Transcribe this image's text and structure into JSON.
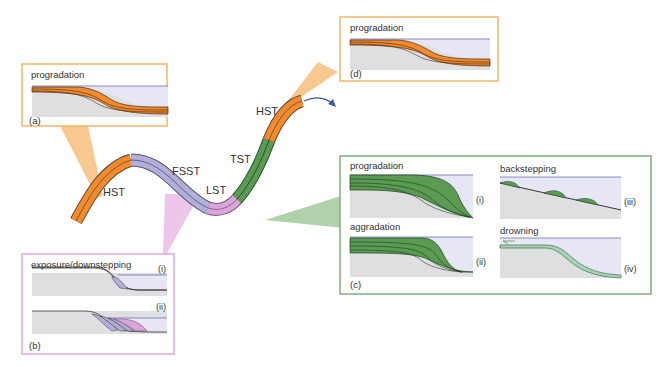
{
  "colors": {
    "orange": "#f28a2e",
    "orange_frame": "#f4b66a",
    "purple": "#b3b0d8",
    "pink": "#d9a6d9",
    "pink_frame": "#e2a6dc",
    "green": "#5a9a52",
    "green_frame": "#7fb07a",
    "sea": "#e6e6f5",
    "sea_line": "#6a6fb8",
    "basement": "#dedfe1",
    "arrow": "#3b5aa0"
  },
  "curve": {
    "labels": {
      "hst_left": "HST",
      "fsst": "FSST",
      "lst": "LST",
      "tst": "TST",
      "hst_right": "HST"
    }
  },
  "panels": {
    "a": {
      "title": "progradation",
      "tag": "(a)"
    },
    "d": {
      "title": "progradation",
      "tag": "(d)"
    },
    "b": {
      "title": "exposure/downstepping",
      "tag": "(b)",
      "sub": [
        {
          "numeral": "(i)"
        },
        {
          "numeral": "(ii)"
        }
      ]
    },
    "c": {
      "tag": "(c)",
      "sub": [
        {
          "title": "progradation",
          "numeral": "(i)"
        },
        {
          "title": "aggradation",
          "numeral": "(ii)"
        },
        {
          "title": "backstepping",
          "numeral": "(iii)"
        },
        {
          "title": "drowning",
          "numeral": "(iv)"
        }
      ]
    }
  }
}
